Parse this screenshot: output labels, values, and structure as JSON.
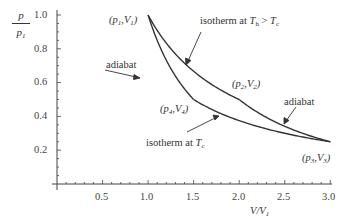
{
  "chart_data": {
    "type": "line",
    "title": "",
    "xlabel": "V/V1",
    "ylabel": "p/p1",
    "xlim": [
      0,
      3.0
    ],
    "ylim": [
      0,
      1.0
    ],
    "grid": false,
    "legend": null,
    "x_ticks": [
      "0.5",
      "1.0",
      "1.5",
      "2.0",
      "2.5",
      "3.0"
    ],
    "y_ticks": [
      "0.2",
      "0.4",
      "0.6",
      "0.8",
      "1.0"
    ],
    "series": [
      {
        "name": "isotherm at Th > Tc",
        "from": "(p1,V1)",
        "to": "(p2,V2)",
        "x": [
          1.0,
          1.25,
          1.5,
          1.75,
          2.0
        ],
        "y": [
          1.0,
          0.8,
          0.667,
          0.571,
          0.5
        ]
      },
      {
        "name": "adiabat (2→3)",
        "from": "(p2,V2)",
        "to": "(p3,V3)",
        "x": [
          2.0,
          2.25,
          2.5,
          2.75,
          3.0
        ],
        "y": [
          0.5,
          0.409,
          0.342,
          0.29,
          0.25
        ]
      },
      {
        "name": "isotherm at Tc",
        "from": "(p4,V4)",
        "to": "(p3,V3)",
        "x": [
          1.5,
          1.75,
          2.0,
          2.5,
          3.0
        ],
        "y": [
          0.5,
          0.429,
          0.375,
          0.3,
          0.25
        ]
      },
      {
        "name": "adiabat (1→4)",
        "from": "(p1,V1)",
        "to": "(p4,V4)",
        "x": [
          1.0,
          1.1,
          1.2,
          1.3,
          1.4,
          1.5
        ],
        "y": [
          1.0,
          0.85,
          0.73,
          0.64,
          0.56,
          0.5
        ]
      }
    ],
    "points": [
      {
        "label": "(p1,V1)",
        "x": 1.0,
        "y": 1.0
      },
      {
        "label": "(p2,V2)",
        "x": 2.0,
        "y": 0.5
      },
      {
        "label": "(p3,V3)",
        "x": 3.0,
        "y": 0.25
      },
      {
        "label": "(p4,V4)",
        "x": 1.5,
        "y": 0.5
      }
    ],
    "annotations": [
      "isotherm at Th > Tc",
      "adiabat",
      "adiabat",
      "isotherm at Tc"
    ]
  },
  "labels": {
    "ylabel_top": "p",
    "ylabel_bottom": "p",
    "ylabel_bottom_sub": "1",
    "xlabel_main": "V/V",
    "xlabel_sub": "1",
    "p1v1": {
      "a": "(p",
      "s1": "1",
      "b": ",V",
      "s2": "1",
      "c": ")"
    },
    "p2v2": {
      "a": "(p",
      "s1": "2",
      "b": ",V",
      "s2": "2",
      "c": ")"
    },
    "p3v3": {
      "a": "(p",
      "s1": "3",
      "b": ",V",
      "s2": "3",
      "c": ")"
    },
    "p4v4": {
      "a": "(p",
      "s1": "4",
      "b": ",V",
      "s2": "4",
      "c": ")"
    },
    "iso_hot": {
      "text": "isotherm at ",
      "T": "T",
      "sub_h": "h",
      "gt": " > ",
      "T2": "T",
      "sub_c": "c"
    },
    "iso_cold": {
      "text": "isotherm at ",
      "T": "T",
      "sub_c": "c"
    },
    "adiabat_left": "adiabat",
    "adiabat_right": "adiabat"
  }
}
